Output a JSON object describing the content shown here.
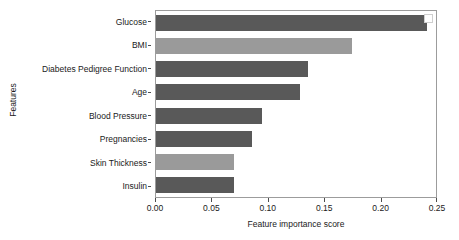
{
  "chart_data": {
    "type": "bar",
    "orientation": "horizontal",
    "title": "",
    "xlabel": "Feature importance score",
    "ylabel": "Features",
    "categories": [
      "Glucose",
      "BMI",
      "Diabetes Pedigree Function",
      "Age",
      "Blood Pressure",
      "Pregnancies",
      "Skin Thickness",
      "Insulin"
    ],
    "values": [
      0.24,
      0.174,
      0.135,
      0.128,
      0.094,
      0.085,
      0.069,
      0.069
    ],
    "bar_colors": [
      "#595959",
      "#9a9a9a",
      "#595959",
      "#595959",
      "#595959",
      "#595959",
      "#9a9a9a",
      "#595959"
    ],
    "xlim": [
      0.0,
      0.25
    ],
    "xticks": [
      0.0,
      0.05,
      0.1,
      0.15,
      0.2,
      0.25
    ],
    "xtick_labels": [
      "0.00",
      "0.05",
      "0.10",
      "0.15",
      "0.20",
      "0.25"
    ],
    "grid": false,
    "legend": null
  },
  "axes": {
    "x_title": "Feature importance score",
    "y_title": "Features"
  }
}
